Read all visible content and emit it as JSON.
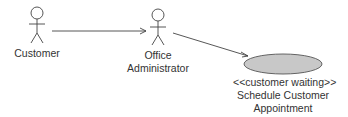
{
  "diagram": {
    "type": "use-case",
    "actors": [
      {
        "id": "customer",
        "label": "Customer"
      },
      {
        "id": "office-admin",
        "label_line1": "Office",
        "label_line2": "Administrator"
      }
    ],
    "use_cases": [
      {
        "id": "schedule",
        "stereotype": "<<customer waiting>>",
        "label_line1": "Schedule Customer",
        "label_line2": "Appointment",
        "fill": "#c8c8c8"
      }
    ],
    "associations": [
      {
        "from": "customer",
        "to": "office-admin",
        "arrow": "open"
      },
      {
        "from": "office-admin",
        "to": "schedule",
        "arrow": "open"
      }
    ]
  }
}
